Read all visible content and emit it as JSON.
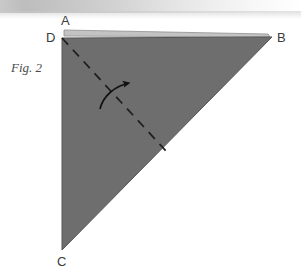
{
  "figure": {
    "caption": "Fig. 2",
    "type": "origami-fold-diagram",
    "colors": {
      "paper_fill": "#6e6e6e",
      "paper_edge": "#565656",
      "flap_highlight": "#c3c3c3",
      "fold_line": "#1d1d1d",
      "arrow": "#111111",
      "label_text": "#3b3b3b",
      "caption_text": "#4a4a4a",
      "page_background": "#ffffff"
    },
    "labels": [
      {
        "name": "A",
        "text": "A",
        "role": "top-flap-corner"
      },
      {
        "name": "B",
        "text": "B",
        "role": "right-corner"
      },
      {
        "name": "C",
        "text": "C",
        "role": "bottom-left-corner"
      },
      {
        "name": "D",
        "text": "D",
        "role": "top-left-corner"
      }
    ],
    "shape": {
      "name": "triangle-ABC",
      "points": "62,38 272,37 62,250",
      "flap_strip_points": "64,30 268,34 270,37 64,36"
    },
    "fold_line": {
      "name": "dashed-fold-line",
      "from": "62,38",
      "to": "166,151",
      "style": "dashed"
    },
    "fold_arrow": {
      "name": "curved-fold-arrow",
      "path": "M 100,109 C 104,96 116,86 130,83",
      "direction": "counter-clockwise-up-right"
    }
  }
}
